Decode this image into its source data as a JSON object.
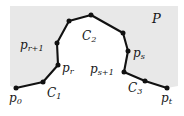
{
  "figure": {
    "name": "polygonal-chain-figure",
    "width": 184,
    "height": 116,
    "background_color": "#ffffff",
    "region_fill_color": "#e8e8e8",
    "chain_color": "#111111",
    "chord_color": "#9a9a9a",
    "vertex_color": "#111111"
  },
  "labels": {
    "p0": {
      "base": "p",
      "sub": "0"
    },
    "C1": {
      "base": "C",
      "sub": "1"
    },
    "pr": {
      "base": "p",
      "sub": "r"
    },
    "pr1": {
      "base": "p",
      "sub": "r+1"
    },
    "C2": {
      "base": "C",
      "sub": "2"
    },
    "P": {
      "base": "P",
      "sub": ""
    },
    "ps": {
      "base": "p",
      "sub": "s"
    },
    "ps1": {
      "base": "p",
      "sub": "s+1"
    },
    "C3": {
      "base": "C",
      "sub": "3"
    },
    "pt": {
      "base": "p",
      "sub": "t"
    }
  },
  "chart_data": {
    "type": "scatter",
    "title": "",
    "xlabel": "",
    "ylabel": "",
    "xlim": [
      0,
      184
    ],
    "ylim": [
      116,
      0
    ],
    "grid": false,
    "legend": null,
    "region_polygon": [
      [
        10,
        6
      ],
      [
        178,
        6
      ],
      [
        178,
        86
      ],
      [
        167,
        88
      ],
      [
        145,
        81
      ],
      [
        124,
        72
      ],
      [
        128,
        51
      ],
      [
        123,
        33
      ],
      [
        91,
        15
      ],
      [
        69,
        21
      ],
      [
        57,
        43
      ],
      [
        58,
        65
      ],
      [
        43,
        82
      ],
      [
        16,
        88
      ],
      [
        10,
        86
      ]
    ],
    "chain_vertices": [
      {
        "label": "p0",
        "x": 16,
        "y": 88
      },
      {
        "label": "",
        "x": 43,
        "y": 82
      },
      {
        "label": "pr",
        "x": 58,
        "y": 65
      },
      {
        "label": "pr1",
        "x": 57,
        "y": 43
      },
      {
        "label": "",
        "x": 69,
        "y": 21
      },
      {
        "label": "",
        "x": 91,
        "y": 15
      },
      {
        "label": "",
        "x": 123,
        "y": 33
      },
      {
        "label": "ps",
        "x": 128,
        "y": 51
      },
      {
        "label": "ps1",
        "x": 124,
        "y": 72
      },
      {
        "label": "",
        "x": 145,
        "y": 81
      },
      {
        "label": "pt",
        "x": 167,
        "y": 88
      }
    ],
    "subchains": [
      {
        "name": "C1",
        "vertex_indices": [
          0,
          1,
          2
        ]
      },
      {
        "name": "C2",
        "vertex_indices": [
          3,
          4,
          5,
          6,
          7
        ]
      },
      {
        "name": "C3",
        "vertex_indices": [
          8,
          9,
          10
        ]
      }
    ],
    "chords": [
      {
        "from": "pr",
        "to": "pr1",
        "x1": 58,
        "y1": 65,
        "x2": 57,
        "y2": 43
      },
      {
        "from": "ps",
        "to": "ps1",
        "x1": 128,
        "y1": 51,
        "x2": 124,
        "y2": 72
      }
    ]
  }
}
